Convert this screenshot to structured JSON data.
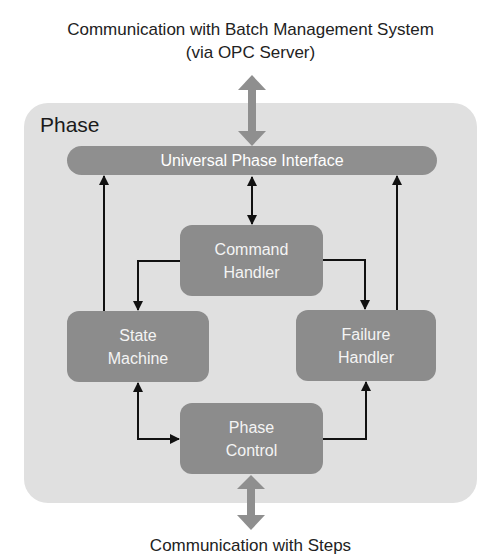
{
  "diagram": {
    "top_caption": {
      "line1": "Communication with Batch Management System",
      "line2": "(via OPC Server)"
    },
    "bottom_caption": "Communication with Steps",
    "container": {
      "label": "Phase"
    },
    "interface_bar": {
      "label": "Universal Phase Interface"
    },
    "nodes": [
      {
        "id": "command-handler",
        "line1": "Command",
        "line2": "Handler"
      },
      {
        "id": "state-machine",
        "line1": "State",
        "line2": "Machine"
      },
      {
        "id": "failure-handler",
        "line1": "Failure",
        "line2": "Handler"
      },
      {
        "id": "phase-control",
        "line1": "Phase",
        "line2": "Control"
      }
    ],
    "edges": [
      {
        "from": "Batch Management System",
        "to": "Universal Phase Interface",
        "type": "bidirectional-thick"
      },
      {
        "from": "Universal Phase Interface",
        "to": "Command Handler",
        "type": "bidirectional"
      },
      {
        "from": "Command Handler",
        "to": "State Machine",
        "type": "directed"
      },
      {
        "from": "Command Handler",
        "to": "Failure Handler",
        "type": "directed"
      },
      {
        "from": "State Machine",
        "to": "Universal Phase Interface",
        "type": "directed"
      },
      {
        "from": "Failure Handler",
        "to": "Universal Phase Interface",
        "type": "directed"
      },
      {
        "from": "State Machine",
        "to": "Phase Control",
        "type": "bidirectional"
      },
      {
        "from": "Phase Control",
        "to": "Failure Handler",
        "type": "directed"
      },
      {
        "from": "Phase Control",
        "to": "Steps",
        "type": "bidirectional-thick"
      }
    ],
    "colors": {
      "container_bg": "#e0e0e0",
      "node_bg": "#8c8c8c",
      "node_text": "#f4f4f4",
      "thick_arrow": "#8f8f8f",
      "line": "#111111"
    }
  }
}
